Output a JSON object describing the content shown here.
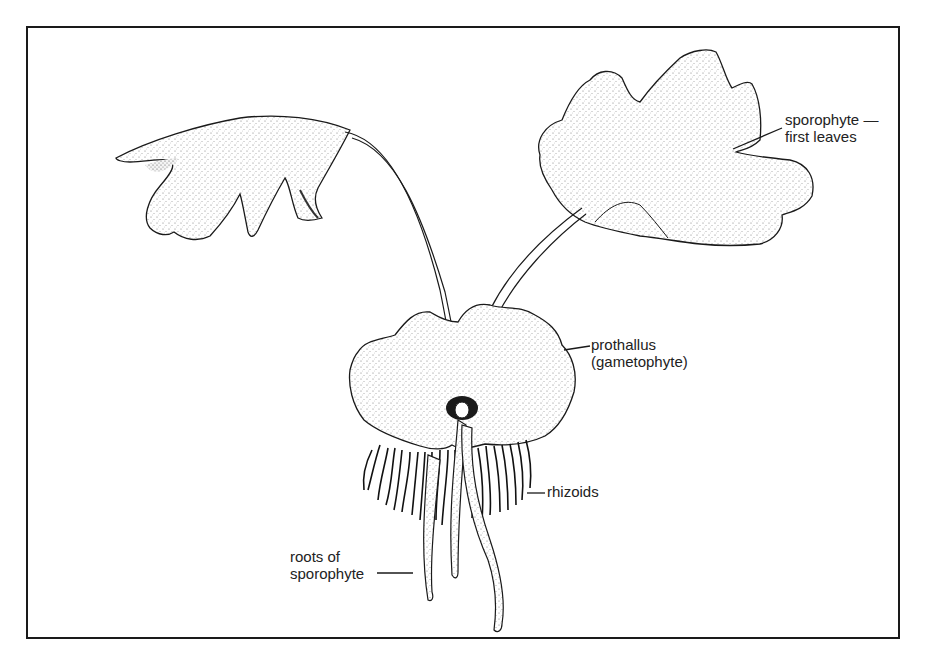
{
  "diagram": {
    "labels": {
      "sporophyte_leaves": {
        "line1": "sporophyte —",
        "line2": "first leaves"
      },
      "prothallus": {
        "line1": "prothallus",
        "line2": "(gametophyte)"
      },
      "rhizoids": {
        "line1": "rhizoids"
      },
      "roots": {
        "line1": "roots of",
        "line2": "sporophyte"
      }
    },
    "colors": {
      "ink": "#1a1a1a",
      "paper": "#ffffff",
      "stipple": "#888888"
    }
  }
}
